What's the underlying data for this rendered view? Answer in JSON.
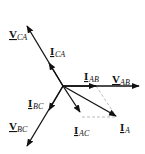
{
  "diagram": {
    "type": "phasor-diagram",
    "origin": [
      63,
      86
    ],
    "colors": {
      "line": "#111111",
      "dashed": "#aaaaaa",
      "background": "#ffffff"
    },
    "phasors": [
      {
        "id": "V_AB",
        "main": "V",
        "sub": "AB",
        "tip": [
          139,
          86
        ],
        "label_pos": [
          112,
          80
        ]
      },
      {
        "id": "V_CA",
        "main": "V",
        "sub": "CA",
        "tip": [
          27,
          26
        ],
        "label_pos": [
          9,
          37
        ]
      },
      {
        "id": "V_BC",
        "main": "V",
        "sub": "BC",
        "tip": [
          27,
          146
        ],
        "label_pos": [
          9,
          129
        ]
      },
      {
        "id": "I_AB",
        "main": "I",
        "sub": "AB",
        "tip": [
          96,
          86
        ],
        "label_pos": [
          83,
          80
        ]
      },
      {
        "id": "I_CA",
        "main": "I",
        "sub": "CA",
        "tip": [
          49,
          63
        ],
        "label_pos": [
          50,
          55
        ]
      },
      {
        "id": "I_BC",
        "main": "I",
        "sub": "BC",
        "tip": [
          49,
          110
        ],
        "label_pos": [
          28,
          108
        ]
      },
      {
        "id": "I_AC",
        "main": "I",
        "sub": "AC",
        "tip": [
          80,
          112
        ],
        "label_pos": [
          74,
          134
        ]
      },
      {
        "id": "I_A",
        "main": "I",
        "sub": "A",
        "tip": [
          116,
          116
        ],
        "label_pos": [
          120,
          131
        ]
      }
    ],
    "dashed_lines": [
      {
        "from": [
          96,
          86
        ],
        "to": [
          116,
          116
        ]
      },
      {
        "from": [
          82,
          117
        ],
        "to": [
          116,
          117
        ]
      }
    ]
  },
  "labels": {
    "V_AB": {
      "main": "V",
      "sub": "AB"
    },
    "V_CA": {
      "main": "V",
      "sub": "CA"
    },
    "V_BC": {
      "main": "V",
      "sub": "BC"
    },
    "I_AB": {
      "main": "I",
      "sub": "AB"
    },
    "I_CA": {
      "main": "I",
      "sub": "CA"
    },
    "I_BC": {
      "main": "I",
      "sub": "BC"
    },
    "I_AC": {
      "main": "I",
      "sub": "AC"
    },
    "I_A": {
      "main": "I",
      "sub": "A"
    }
  }
}
